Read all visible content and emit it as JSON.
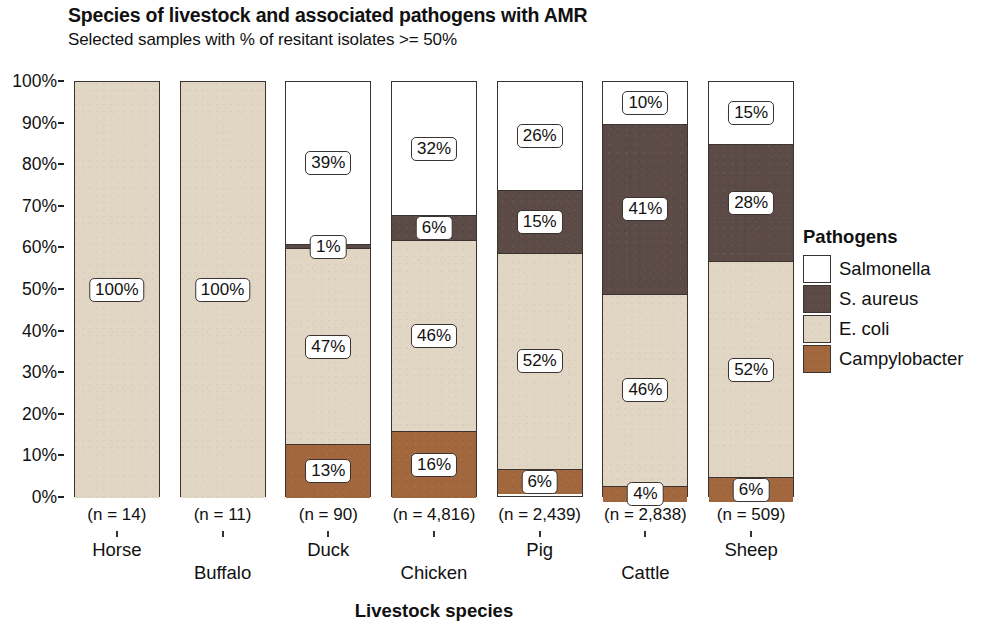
{
  "chart_data": {
    "type": "bar",
    "subtype": "stacked-percent",
    "title": "Species of livestock and associated pathogens with AMR",
    "subtitle": "Selected samples with % of resitant isolates >= 50%",
    "xlabel": "Livestock species",
    "ylabel": "",
    "ylim": [
      0,
      100
    ],
    "ytick_labels": [
      "100%",
      "90%",
      "80%",
      "70%",
      "60%",
      "50%",
      "40%",
      "30%",
      "20%",
      "10%",
      "0%"
    ],
    "ytick_values": [
      100,
      90,
      80,
      70,
      60,
      50,
      40,
      30,
      20,
      10,
      0
    ],
    "grid": false,
    "legend_position": "right",
    "legend_title": "Pathogens",
    "categories": [
      "Horse",
      "Buffalo",
      "Duck",
      "Chicken",
      "Pig",
      "Cattle",
      "Sheep"
    ],
    "sample_sizes": [
      "(n = 14)",
      "(n = 11)",
      "(n = 90)",
      "(n = 4,816)",
      "(n = 2,439)",
      "(n = 2,838)",
      "(n = 509)"
    ],
    "series": [
      {
        "name": "Salmonella",
        "color": "#ffffff",
        "values": [
          0,
          0,
          39,
          32,
          26,
          10,
          15
        ]
      },
      {
        "name": "S. aureus",
        "color": "#5b4a46",
        "values": [
          0,
          0,
          1,
          6,
          15,
          41,
          28
        ]
      },
      {
        "name": "E. coli",
        "color": "#e0d6c3",
        "values": [
          100,
          100,
          47,
          46,
          52,
          46,
          52
        ]
      },
      {
        "name": "Campylobacter",
        "color": "#a3673d",
        "values": [
          0,
          0,
          13,
          16,
          6,
          4,
          6
        ]
      }
    ],
    "bar_labels": [
      {
        "category": "Horse",
        "labels": [
          {
            "series": "E. coli",
            "text": "100%"
          }
        ]
      },
      {
        "category": "Buffalo",
        "labels": [
          {
            "series": "E. coli",
            "text": "100%"
          }
        ]
      },
      {
        "category": "Duck",
        "labels": [
          {
            "series": "Salmonella",
            "text": "39%"
          },
          {
            "series": "S. aureus",
            "text": "1%"
          },
          {
            "series": "E. coli",
            "text": "47%"
          },
          {
            "series": "Campylobacter",
            "text": "13%"
          }
        ]
      },
      {
        "category": "Chicken",
        "labels": [
          {
            "series": "Salmonella",
            "text": "32%"
          },
          {
            "series": "S. aureus",
            "text": "6%"
          },
          {
            "series": "E. coli",
            "text": "46%"
          },
          {
            "series": "Campylobacter",
            "text": "16%"
          }
        ]
      },
      {
        "category": "Pig",
        "labels": [
          {
            "series": "Salmonella",
            "text": "26%"
          },
          {
            "series": "S. aureus",
            "text": "15%"
          },
          {
            "series": "E. coli",
            "text": "52%"
          },
          {
            "series": "Campylobacter",
            "text": "6%"
          }
        ]
      },
      {
        "category": "Cattle",
        "labels": [
          {
            "series": "Salmonella",
            "text": "10%"
          },
          {
            "series": "S. aureus",
            "text": "41%"
          },
          {
            "series": "E. coli",
            "text": "46%"
          },
          {
            "series": "Campylobacter",
            "text": "4%"
          }
        ]
      },
      {
        "category": "Sheep",
        "labels": [
          {
            "series": "Salmonella",
            "text": "15%"
          },
          {
            "series": "S. aureus",
            "text": "28%"
          },
          {
            "series": "E. coli",
            "text": "52%"
          },
          {
            "series": "Campylobacter",
            "text": "6%"
          }
        ]
      }
    ]
  },
  "colors": {
    "salmonella": "#ffffff",
    "s_aureus": "#5b4a46",
    "e_coli": "#e0d6c3",
    "campylobacter": "#a3673d",
    "outline": "#3a3330",
    "text": "#111111",
    "background": "#ffffff"
  }
}
